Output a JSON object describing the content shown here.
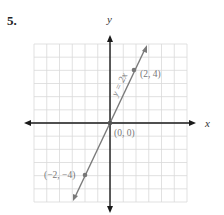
{
  "problem": {
    "number": "5."
  },
  "graph": {
    "x_axis_label": "x",
    "y_axis_label": "y",
    "grid": {
      "xmin": -6,
      "xmax": 6,
      "ymin": -6,
      "ymax": 6,
      "step": 1
    },
    "line": {
      "equation": "y = 2x",
      "slope": 2,
      "intercept": 0
    },
    "points": [
      {
        "label": "(2, 4)",
        "x": 2,
        "y": 4
      },
      {
        "label": "(0, 0)",
        "x": 0,
        "y": 0
      },
      {
        "label": "(−2, −4)",
        "x": -2,
        "y": -4
      }
    ],
    "colors": {
      "grid": "#d9d9d9",
      "axis": "#1a1a1a",
      "line": "#7a7a7a",
      "label": "#777777"
    }
  },
  "chart_data": {
    "type": "line",
    "title": "5.",
    "xlabel": "x",
    "ylabel": "y",
    "xlim": [
      -6,
      6
    ],
    "ylim": [
      -6,
      6
    ],
    "grid": true,
    "series": [
      {
        "name": "y = 2x",
        "x": [
          -3,
          -2,
          0,
          2,
          3
        ],
        "y": [
          -6,
          -4,
          0,
          4,
          6
        ]
      }
    ],
    "annotations": [
      "(2, 4)",
      "(0, 0)",
      "(−2, −4)",
      "y = 2x"
    ]
  }
}
